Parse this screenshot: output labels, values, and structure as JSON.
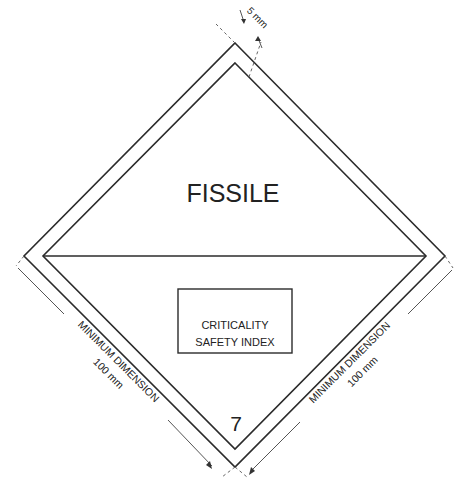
{
  "label": {
    "title": "FISSILE",
    "box_line1": "CRITICALITY",
    "box_line2": "SAFETY INDEX",
    "class_number": "7"
  },
  "dimensions": {
    "border_width": "5 mm",
    "left_line1": "MINIMUM DIMENSION",
    "left_line2": "100 mm",
    "right_line1": "MINIMUM DIMENSION",
    "right_line2": "100 mm"
  },
  "colors": {
    "stroke": "#2b2b2b",
    "background": "#ffffff"
  }
}
